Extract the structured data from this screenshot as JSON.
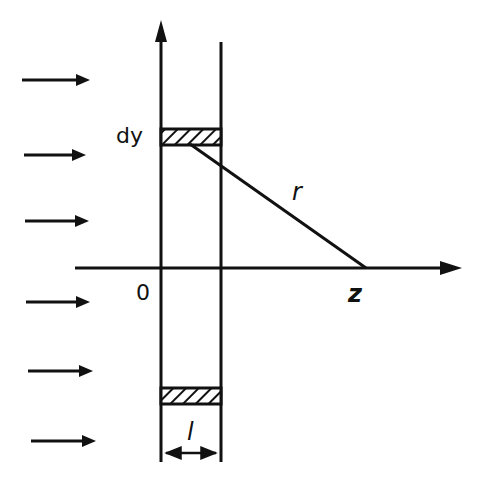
{
  "diagram": {
    "labels": {
      "dy": "dy",
      "r": "r",
      "origin": "0",
      "z": "z",
      "l": "l"
    },
    "incident_arrows_count": 6,
    "colors": {
      "ink": "#111111",
      "background": "#ffffff"
    }
  }
}
